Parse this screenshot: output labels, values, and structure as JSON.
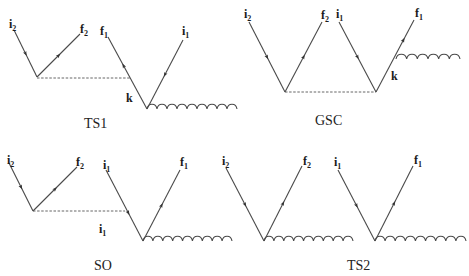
{
  "figure": {
    "width": 469,
    "height": 276,
    "colors": {
      "line": "#4a4a4a",
      "text": "#1a1a1a",
      "background": "#ffffff"
    },
    "diagrams": [
      {
        "id": "TS1",
        "title": {
          "text": "TS1",
          "x": 84,
          "y": 128
        },
        "lines": [
          {
            "x1": 14,
            "y1": 30,
            "x2": 37,
            "y2": 77,
            "arrow": "toward_vertex"
          },
          {
            "x1": 37,
            "y1": 77,
            "x2": 80,
            "y2": 34,
            "arrow": "away_from_vertex"
          },
          {
            "x1": 147,
            "y1": 109,
            "x2": 108,
            "y2": 37,
            "arrow": "away_from_vertex",
            "arrow_at": 0.6
          },
          {
            "x1": 183,
            "y1": 40,
            "x2": 147,
            "y2": 109,
            "arrow": "toward_vertex"
          }
        ],
        "dashed": [
          {
            "x1": 37,
            "y1": 78,
            "x2": 130,
            "y2": 78
          }
        ],
        "waves": [
          {
            "x1": 147,
            "y1": 109,
            "x2": 237,
            "periods": 9
          }
        ],
        "labels": [
          {
            "main": "i",
            "sub": "2",
            "x": 9,
            "y": 28
          },
          {
            "main": "f",
            "sub": "2",
            "x": 80,
            "y": 33
          },
          {
            "main": "f",
            "sub": "1",
            "x": 100,
            "y": 35
          },
          {
            "main": "i",
            "sub": "1",
            "x": 182,
            "y": 35
          },
          {
            "main": "k",
            "sub": "",
            "x": 126,
            "y": 102
          }
        ]
      },
      {
        "id": "GSC",
        "title": {
          "text": "GSC",
          "x": 315,
          "y": 125
        },
        "lines": [
          {
            "x1": 249,
            "y1": 22,
            "x2": 285,
            "y2": 92,
            "arrow": "toward_vertex"
          },
          {
            "x1": 285,
            "y1": 92,
            "x2": 322,
            "y2": 22,
            "arrow": "away_from_vertex"
          },
          {
            "x1": 339,
            "y1": 22,
            "x2": 376,
            "y2": 92,
            "arrow": "toward_vertex"
          },
          {
            "x1": 376,
            "y1": 92,
            "x2": 414,
            "y2": 20,
            "arrow": "away_from_vertex",
            "arrow_at": 0.72
          }
        ],
        "dashed": [
          {
            "x1": 285,
            "y1": 92,
            "x2": 376,
            "y2": 92
          }
        ],
        "waves": [
          {
            "x1": 396,
            "y1": 59,
            "x2": 460,
            "periods": 6
          }
        ],
        "labels": [
          {
            "main": "i",
            "sub": "2",
            "x": 244,
            "y": 18
          },
          {
            "main": "f",
            "sub": "2",
            "x": 321,
            "y": 19
          },
          {
            "main": "i",
            "sub": "1",
            "x": 336,
            "y": 18
          },
          {
            "main": "f",
            "sub": "1",
            "x": 415,
            "y": 17
          },
          {
            "main": "k",
            "sub": "",
            "x": 391,
            "y": 80
          }
        ]
      },
      {
        "id": "SO",
        "title": {
          "text": "SO",
          "x": 94,
          "y": 270
        },
        "lines": [
          {
            "x1": 9,
            "y1": 163,
            "x2": 33,
            "y2": 211,
            "arrow": "toward_vertex"
          },
          {
            "x1": 33,
            "y1": 211,
            "x2": 77,
            "y2": 167,
            "arrow": "away_from_vertex"
          },
          {
            "x1": 106,
            "y1": 170,
            "x2": 143,
            "y2": 241,
            "arrow": "toward_vertex",
            "arrow_at": 0.6
          },
          {
            "x1": 143,
            "y1": 241,
            "x2": 180,
            "y2": 170,
            "arrow": "away_from_vertex"
          }
        ],
        "dashed": [
          {
            "x1": 33,
            "y1": 211,
            "x2": 125,
            "y2": 211
          }
        ],
        "waves": [
          {
            "x1": 143,
            "y1": 241,
            "x2": 232,
            "periods": 9
          }
        ],
        "labels": [
          {
            "main": "i",
            "sub": "2",
            "x": 7,
            "y": 164
          },
          {
            "main": "f",
            "sub": "2",
            "x": 76,
            "y": 166
          },
          {
            "main": "i",
            "sub": "1",
            "x": 103,
            "y": 169
          },
          {
            "main": "f",
            "sub": "1",
            "x": 180,
            "y": 166
          },
          {
            "main": "i",
            "sub": "1",
            "x": 99,
            "y": 233
          }
        ]
      },
      {
        "id": "TS2",
        "title": {
          "text": "TS2",
          "x": 347,
          "y": 270
        },
        "lines": [
          {
            "x1": 226,
            "y1": 168,
            "x2": 264,
            "y2": 241,
            "arrow": "toward_vertex"
          },
          {
            "x1": 264,
            "y1": 241,
            "x2": 302,
            "y2": 166,
            "arrow": "away_from_vertex"
          },
          {
            "x1": 338,
            "y1": 170,
            "x2": 375,
            "y2": 241,
            "arrow": "toward_vertex"
          },
          {
            "x1": 375,
            "y1": 241,
            "x2": 413,
            "y2": 166,
            "arrow": "away_from_vertex"
          }
        ],
        "dashed": [],
        "waves": [
          {
            "x1": 264,
            "y1": 241,
            "x2": 353,
            "periods": 9
          },
          {
            "x1": 375,
            "y1": 241,
            "x2": 466,
            "periods": 9
          }
        ],
        "labels": [
          {
            "main": "i",
            "sub": "2",
            "x": 222,
            "y": 165
          },
          {
            "main": "f",
            "sub": "2",
            "x": 303,
            "y": 165
          },
          {
            "main": "i",
            "sub": "1",
            "x": 334,
            "y": 166
          },
          {
            "main": "f",
            "sub": "1",
            "x": 414,
            "y": 164
          }
        ]
      }
    ]
  }
}
